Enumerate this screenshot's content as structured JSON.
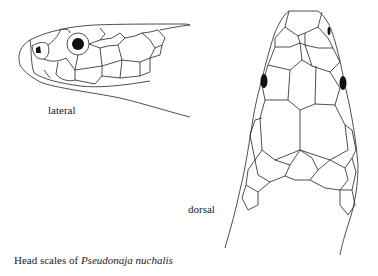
{
  "figure": {
    "labels": {
      "lateral": "lateral",
      "dorsal": "dorsal"
    },
    "caption": {
      "prefix": "Head scales of ",
      "species": "Pseudonaja nuchalis"
    },
    "colors": {
      "line": "#222222",
      "background": "#ffffff"
    }
  }
}
